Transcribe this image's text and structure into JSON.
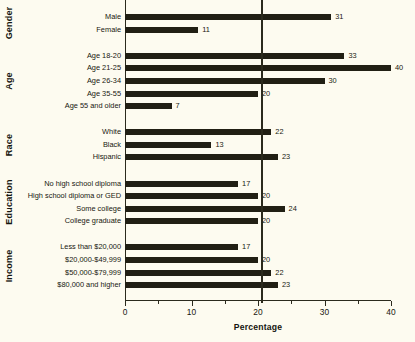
{
  "chart_data": {
    "type": "bar",
    "orientation": "horizontal",
    "title": "",
    "xlabel": "Percentage",
    "ylabel": "",
    "xlim": [
      0,
      40
    ],
    "xticks": [
      0,
      10,
      20,
      30,
      40
    ],
    "xtick_labels": [
      "0",
      "10",
      "20",
      "30",
      "40"
    ],
    "minor_tick_step": 5,
    "grid": false,
    "legend": null,
    "reference_line": {
      "value": 20.5,
      "label": "",
      "style": "solid"
    },
    "bar_color": "#211f14",
    "background_color": "#fdfbf0",
    "groups": [
      {
        "name": "Gender",
        "categories": [
          "Male",
          "Female"
        ],
        "values": [
          31,
          11
        ]
      },
      {
        "name": "Age",
        "categories": [
          "Age 18-20",
          "Age 21-25",
          "Age 26-34",
          "Age 35-55",
          "Age 55 and older"
        ],
        "values": [
          33,
          40,
          30,
          20,
          7
        ]
      },
      {
        "name": "Race",
        "categories": [
          "White",
          "Black",
          "Hispanic"
        ],
        "values": [
          22,
          13,
          23
        ]
      },
      {
        "name": "Education",
        "categories": [
          "No high school diploma",
          "High school diploma or GED",
          "Some college",
          "College graduate"
        ],
        "values": [
          17,
          20,
          24,
          20
        ]
      },
      {
        "name": "Income",
        "categories": [
          "Less than $20,000",
          "$20,000-$49,999",
          "$50,000-$79,999",
          "$80,000 and higher"
        ],
        "values": [
          17,
          20,
          22,
          23
        ]
      }
    ]
  }
}
